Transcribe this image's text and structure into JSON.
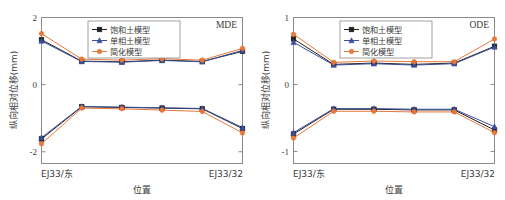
{
  "figure": {
    "panels": [
      {
        "tag": "MDE",
        "xlabel": "位置",
        "ylabel": "纵向相对位移(mm)",
        "xticklabels": [
          "EJ33/东",
          "EJ33/32"
        ],
        "yticklabels": [
          "2",
          "0",
          "-2"
        ]
      },
      {
        "tag": "ODE",
        "xlabel": "位置",
        "ylabel": "纵向相对位移(mm)",
        "xticklabels": [
          "EJ33/东",
          "EJ33/32"
        ],
        "yticklabels": [
          "1",
          "0",
          "-1"
        ]
      }
    ],
    "legend": {
      "items": [
        {
          "label": "饱和土模型",
          "marker": "square",
          "color": "#1f1f1f"
        },
        {
          "label": "单相土模型",
          "marker": "triangle",
          "color": "#3a4f9c"
        },
        {
          "label": "简化模型",
          "marker": "circle",
          "color": "#e8773a"
        }
      ]
    },
    "colors": {
      "saturated_soil": "#1f1f1f",
      "single_phase_soil": "#3a4f9c",
      "simplified": "#e8773a",
      "frame": "#8a8a8a",
      "text": "#3a3a3a"
    }
  },
  "chart_data": [
    {
      "type": "line",
      "title": "MDE",
      "xlabel": "位置",
      "ylabel": "纵向相对位移(mm)",
      "xlim": [
        0,
        5
      ],
      "ylim": [
        -2.35,
        2.0
      ],
      "yticks": [
        2,
        0,
        -2
      ],
      "xticks": [
        0,
        5
      ],
      "xticklabels": [
        "EJ33/东",
        "EJ33/32"
      ],
      "grid": false,
      "legend_position": "top-center",
      "x": [
        0,
        1,
        2,
        3,
        4,
        5
      ],
      "series": [
        {
          "name": "饱和土模型-上",
          "color": "#1f1f1f",
          "marker": "square",
          "values": [
            1.34,
            0.7,
            0.68,
            0.73,
            0.69,
            0.99
          ]
        },
        {
          "name": "单相土模型-上",
          "color": "#3a4f9c",
          "marker": "triangle",
          "values": [
            1.3,
            0.69,
            0.67,
            0.72,
            0.68,
            1.02
          ]
        },
        {
          "name": "简化模型-上",
          "color": "#e8773a",
          "marker": "circle",
          "values": [
            1.52,
            0.76,
            0.73,
            0.77,
            0.73,
            1.08
          ]
        },
        {
          "name": "饱和土模型-下",
          "color": "#1f1f1f",
          "marker": "square",
          "values": [
            -1.62,
            -0.66,
            -0.68,
            -0.7,
            -0.72,
            -1.31
          ]
        },
        {
          "name": "单相土模型-下",
          "color": "#3a4f9c",
          "marker": "triangle",
          "values": [
            -1.58,
            -0.65,
            -0.67,
            -0.69,
            -0.71,
            -1.28
          ]
        },
        {
          "name": "简化模型-下",
          "color": "#e8773a",
          "marker": "circle",
          "values": [
            -1.76,
            -0.7,
            -0.72,
            -0.76,
            -0.8,
            -1.44
          ]
        }
      ]
    },
    {
      "type": "line",
      "title": "ODE",
      "xlabel": "位置",
      "ylabel": "纵向相对位移(mm)",
      "xlim": [
        0,
        5
      ],
      "ylim": [
        -1.18,
        1.0
      ],
      "yticks": [
        1,
        0,
        -1
      ],
      "xticks": [
        0,
        5
      ],
      "xticklabels": [
        "EJ33/东",
        "EJ33/32"
      ],
      "grid": false,
      "legend_position": "top-center",
      "x": [
        0,
        1,
        2,
        3,
        4,
        5
      ],
      "series": [
        {
          "name": "饱和土模型-上",
          "color": "#1f1f1f",
          "marker": "square",
          "values": [
            0.68,
            0.3,
            0.32,
            0.3,
            0.32,
            0.57
          ]
        },
        {
          "name": "单相土模型-上",
          "color": "#3a4f9c",
          "marker": "triangle",
          "values": [
            0.63,
            0.29,
            0.31,
            0.29,
            0.31,
            0.56
          ]
        },
        {
          "name": "简化模型-上",
          "color": "#e8773a",
          "marker": "circle",
          "values": [
            0.75,
            0.33,
            0.35,
            0.34,
            0.34,
            0.68
          ]
        },
        {
          "name": "饱和土模型-下",
          "color": "#1f1f1f",
          "marker": "square",
          "values": [
            -0.74,
            -0.37,
            -0.37,
            -0.38,
            -0.38,
            -0.68
          ]
        },
        {
          "name": "单相土模型-下",
          "color": "#3a4f9c",
          "marker": "triangle",
          "values": [
            -0.72,
            -0.36,
            -0.36,
            -0.37,
            -0.37,
            -0.63
          ]
        },
        {
          "name": "简化模型-下",
          "color": "#e8773a",
          "marker": "circle",
          "values": [
            -0.8,
            -0.4,
            -0.4,
            -0.41,
            -0.41,
            -0.72
          ]
        }
      ]
    }
  ]
}
